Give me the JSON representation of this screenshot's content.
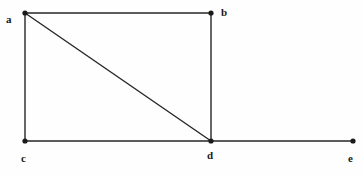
{
  "figure": {
    "kind": "undirected-graph-drawing",
    "background_color": "#fefefe",
    "edge_color": "#262626",
    "vertex_color": "#1a1a1a",
    "label_color": "#1a1a1a",
    "edge_width": 1.4,
    "vertex_radius": 2.6,
    "width": 362,
    "height": 176
  },
  "vertices": [
    {
      "id": "a",
      "label": "a",
      "x": 25,
      "y": 13,
      "label_x": 6,
      "label_y": 14
    },
    {
      "id": "b",
      "label": "b",
      "x": 211,
      "y": 13,
      "label_x": 221,
      "label_y": 7
    },
    {
      "id": "c",
      "label": "c",
      "x": 25,
      "y": 141,
      "label_x": 21,
      "label_y": 153
    },
    {
      "id": "d",
      "label": "d",
      "x": 211,
      "y": 141,
      "label_x": 207,
      "label_y": 150
    },
    {
      "id": "e",
      "label": "e",
      "x": 353,
      "y": 141,
      "label_x": 348,
      "label_y": 153
    }
  ],
  "edges": [
    {
      "id": "ab",
      "from": "a",
      "to": "b",
      "x1": 25,
      "y1": 13,
      "x2": 211,
      "y2": 13
    },
    {
      "id": "ac",
      "from": "a",
      "to": "c",
      "x1": 25,
      "y1": 13,
      "x2": 25,
      "y2": 141
    },
    {
      "id": "ad",
      "from": "a",
      "to": "d",
      "x1": 25,
      "y1": 13,
      "x2": 211,
      "y2": 141
    },
    {
      "id": "bd",
      "from": "b",
      "to": "d",
      "x1": 211,
      "y1": 13,
      "x2": 211,
      "y2": 141
    },
    {
      "id": "cd",
      "from": "c",
      "to": "d",
      "x1": 25,
      "y1": 141,
      "x2": 211,
      "y2": 141
    },
    {
      "id": "de",
      "from": "d",
      "to": "e",
      "x1": 211,
      "y1": 141,
      "x2": 353,
      "y2": 141
    }
  ]
}
